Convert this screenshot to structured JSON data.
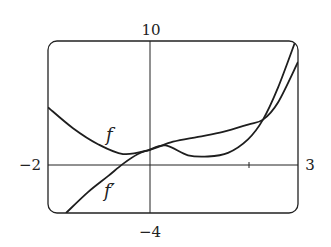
{
  "chart_data": {
    "type": "line",
    "title": "",
    "xlabel": "",
    "ylabel": "",
    "xlim": [
      -2,
      3
    ],
    "ylim": [
      -4,
      10
    ],
    "grid": false,
    "legend": "inline labels",
    "tick_labels": {
      "x_min": "−2",
      "x_max": "3",
      "y_max": "10",
      "y_min": "−4"
    },
    "x_ticks": [
      2
    ],
    "series": [
      {
        "name": "f",
        "label": "f",
        "x": [
          -2.0,
          -1.5,
          -1.0,
          -0.5,
          0.0,
          0.5,
          1.0,
          1.5,
          2.0,
          2.3,
          2.6,
          3.0
        ],
        "values": [
          4.6,
          2.9,
          1.6,
          0.8,
          1.1,
          1.8,
          2.2,
          2.6,
          3.2,
          3.6,
          5.0,
          8.3
        ]
      },
      {
        "name": "f'",
        "label": "f′",
        "x": [
          -1.64,
          -1.2,
          -0.8,
          -0.5,
          -0.2,
          0.0,
          0.35,
          0.8,
          1.2,
          1.6,
          2.0,
          2.3,
          2.6,
          2.95
        ],
        "values": [
          -4.0,
          -2.3,
          -1.0,
          0.0,
          0.8,
          1.1,
          1.5,
          0.7,
          0.6,
          0.9,
          2.0,
          3.6,
          6.2,
          10.0
        ]
      }
    ],
    "annotations": [
      {
        "text": "f",
        "near_x": -0.8,
        "near_y": 2.6
      },
      {
        "text": "f′",
        "near_x": -0.8,
        "near_y": -1.9
      }
    ]
  }
}
